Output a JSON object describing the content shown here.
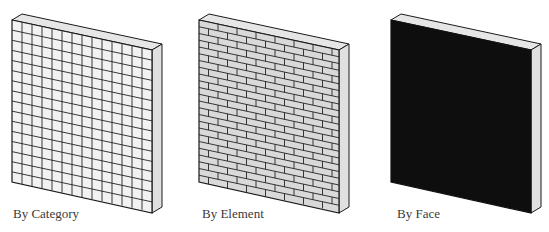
{
  "panels": [
    {
      "id": "category",
      "label": "By Category",
      "pattern": "grid",
      "face_color": "#f2f2f2",
      "line_color": "#222222"
    },
    {
      "id": "element",
      "label": "By Element",
      "pattern": "brick",
      "face_color": "#d9d9d9",
      "line_color": "#222222"
    },
    {
      "id": "face",
      "label": "By Face",
      "pattern": "solid",
      "face_color": "#0e0e0e",
      "line_color": "#111111"
    }
  ],
  "colors": {
    "top_face": "#e6e6e6",
    "side_face": "#e0e0e0",
    "edge": "#1a1a1a",
    "label_text": "#3a3a3a"
  }
}
